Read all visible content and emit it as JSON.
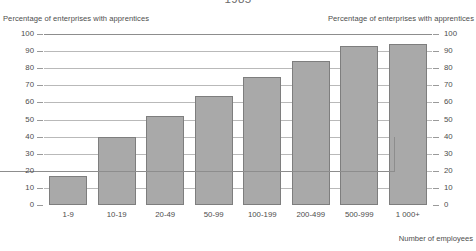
{
  "chart_data": {
    "type": "bar",
    "title": "1985",
    "categories": [
      "1-9",
      "10-19",
      "20-49",
      "50-99",
      "100-199",
      "200-499",
      "500-999",
      "1 000+"
    ],
    "values": [
      17,
      40,
      52,
      64,
      75,
      84,
      93,
      94
    ],
    "xlabel": "Number of employees",
    "ylabel": "Percentage of enterprises with apprentices",
    "ylabel_right": "Percentage of enterprises with apprentices",
    "ylim": [
      0,
      100
    ],
    "ytick_step": 10,
    "yticks": [
      100,
      90,
      80,
      70,
      60,
      50,
      40,
      30,
      20,
      10,
      0
    ],
    "ytick_labels": [
      "100",
      "90",
      "80",
      "70",
      "60",
      "50",
      "40",
      "30",
      "20",
      "10",
      "0"
    ],
    "grid": true,
    "legend": "none",
    "bar_color": "#a9a9a9",
    "bar_border_color": "#7e7e7e",
    "gridline_color": "#b9b9b9",
    "axis_color": "#8d8d8d",
    "background": "#ffffff"
  }
}
